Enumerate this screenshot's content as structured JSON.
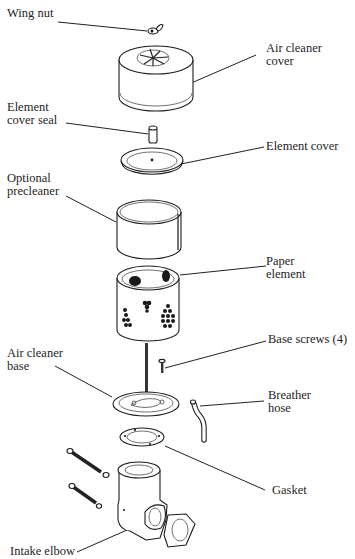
{
  "diagram": {
    "type": "exploded-parts-view",
    "labels": [
      {
        "id": "wing-nut",
        "text": "Wing nut"
      },
      {
        "id": "air-cleaner-cover",
        "text": "Air cleaner\ncover"
      },
      {
        "id": "element-cover-seal",
        "text": "Element\ncover seal"
      },
      {
        "id": "element-cover",
        "text": "Element cover"
      },
      {
        "id": "optional-precleaner",
        "text": "Optional\nprecleaner"
      },
      {
        "id": "paper-element",
        "text": "Paper\nelement"
      },
      {
        "id": "base-screws",
        "text": "Base screws (4)"
      },
      {
        "id": "air-cleaner-base",
        "text": "Air cleaner\nbase"
      },
      {
        "id": "breather-hose",
        "text": "Breather\nhose"
      },
      {
        "id": "gasket",
        "text": "Gasket"
      },
      {
        "id": "intake-elbow",
        "text": "Intake elbow"
      }
    ]
  }
}
